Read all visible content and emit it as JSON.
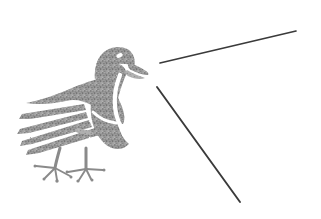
{
  "artwork": {
    "title": "Stippled Bird Illustration",
    "subject_label": "bird",
    "background_color": "#ffffff",
    "stipple_color": "#8a8a8a",
    "stipple_color_light": "#a8a8a8",
    "line_color": "#3a3a3a",
    "canvas": {
      "width": 321,
      "height": 219
    },
    "parts": [
      {
        "name": "head",
        "label": "head"
      },
      {
        "name": "eye",
        "label": "eye"
      },
      {
        "name": "beak",
        "label": "beak"
      },
      {
        "name": "body",
        "label": "body"
      },
      {
        "name": "wing",
        "label": "wing"
      },
      {
        "name": "tail",
        "label": "tail feathers"
      },
      {
        "name": "legs",
        "label": "legs"
      },
      {
        "name": "feet",
        "label": "feet and claws"
      }
    ],
    "tail_feather_count": 4,
    "claw_count": 8,
    "lines": [
      {
        "name": "upper-diagonal-line",
        "label": "upper diagonal line",
        "x1": 160,
        "y1": 63,
        "x2": 296,
        "y2": 31,
        "stroke_width": 1.7
      },
      {
        "name": "lower-diagonal-line",
        "label": "lower diagonal line",
        "x1": 157,
        "y1": 87,
        "x2": 240,
        "y2": 202,
        "stroke_width": 1.9
      }
    ]
  }
}
